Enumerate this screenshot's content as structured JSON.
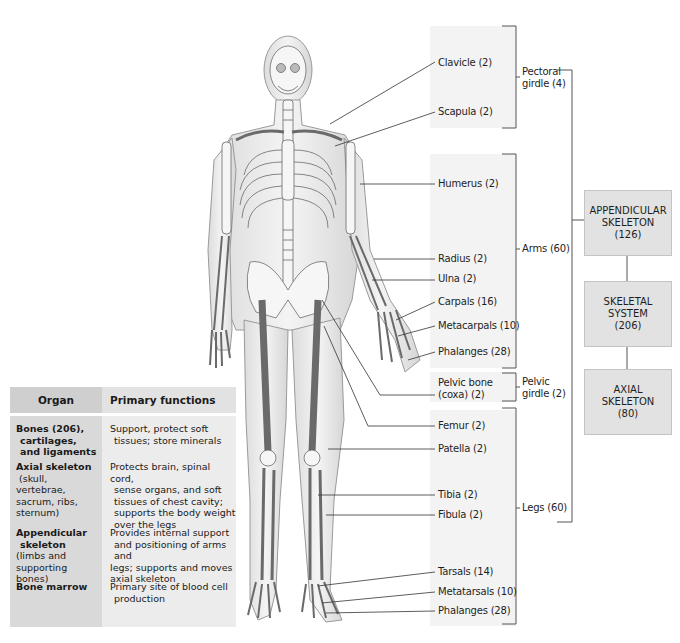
{
  "figure": {
    "title": "Skeletal system",
    "hierarchy": {
      "root": {
        "label": "SKELETAL\nSYSTEM\n(206)",
        "name": "Skeletal system",
        "count": 206
      },
      "appendicular": {
        "label": "APPENDICULAR\nSKELETON\n(126)",
        "name": "Appendicular skeleton",
        "count": 126
      },
      "axial": {
        "label": "AXIAL\nSKELETON\n(80)",
        "name": "Axial skeleton",
        "count": 80
      },
      "colors": {
        "box_fill": "#e2e2e2",
        "box_border": "#c4c4c4",
        "panel_fill": "#f3f3f3",
        "line": "#555555"
      }
    },
    "groups": {
      "pectoral_girdle": {
        "line1": "Pectoral",
        "line2": "girdle (4)"
      },
      "arms": {
        "line1": "Arms (60)"
      },
      "pelvic_girdle": {
        "line1": "Pelvic",
        "line2": "girdle (2)"
      },
      "legs": {
        "line1": "Legs (60)"
      }
    },
    "bone_labels": [
      {
        "id": "clavicle",
        "text": "Clavicle (2)"
      },
      {
        "id": "scapula",
        "text": "Scapula (2)"
      },
      {
        "id": "humerus",
        "text": "Humerus (2)"
      },
      {
        "id": "radius",
        "text": "Radius (2)"
      },
      {
        "id": "ulna",
        "text": "Ulna (2)"
      },
      {
        "id": "carpals",
        "text": "Carpals (16)"
      },
      {
        "id": "metacarpals",
        "text": "Metacarpals (10)"
      },
      {
        "id": "hand_phalanges",
        "text": "Phalanges (28)"
      },
      {
        "id": "pelvic_bone",
        "text": "Pelvic bone",
        "text2": "(coxa) (2)"
      },
      {
        "id": "femur",
        "text": "Femur (2)"
      },
      {
        "id": "patella",
        "text": "Patella (2)"
      },
      {
        "id": "tibia",
        "text": "Tibia (2)"
      },
      {
        "id": "fibula",
        "text": "Fibula (2)"
      },
      {
        "id": "tarsals",
        "text": "Tarsals (14)"
      },
      {
        "id": "metatarsals",
        "text": "Metatarsals (10)"
      },
      {
        "id": "foot_phalanges",
        "text": "Phalanges (28)"
      }
    ]
  },
  "table": {
    "headers": {
      "organ": "Organ",
      "functions": "Primary functions"
    },
    "rows": [
      {
        "organ_bold": [
          "Bones (206),",
          "cartilages,",
          "and ligaments"
        ],
        "organ_detail": [],
        "functions": [
          "Support, protect soft",
          "tissues; store minerals"
        ]
      },
      {
        "organ_bold": [
          "Axial skeleton"
        ],
        "organ_detail": [
          "(skull,",
          "vertebrae,",
          "sacrum, ribs,",
          "sternum)"
        ],
        "functions": [
          "Protects brain, spinal cord,",
          "sense organs, and soft",
          "tissues of chest cavity;",
          "supports the body weight",
          "over the legs"
        ]
      },
      {
        "organ_bold": [
          "Appendicular",
          "skeleton"
        ],
        "organ_detail": [
          "(limbs and",
          "supporting bones)"
        ],
        "functions": [
          "Provides internal support",
          "and positioning of arms and",
          "legs; supports and moves",
          "axial skeleton"
        ]
      },
      {
        "organ_bold": [
          "Bone marrow"
        ],
        "organ_detail": [],
        "functions": [
          "Primary site of blood cell",
          "production"
        ]
      }
    ]
  }
}
